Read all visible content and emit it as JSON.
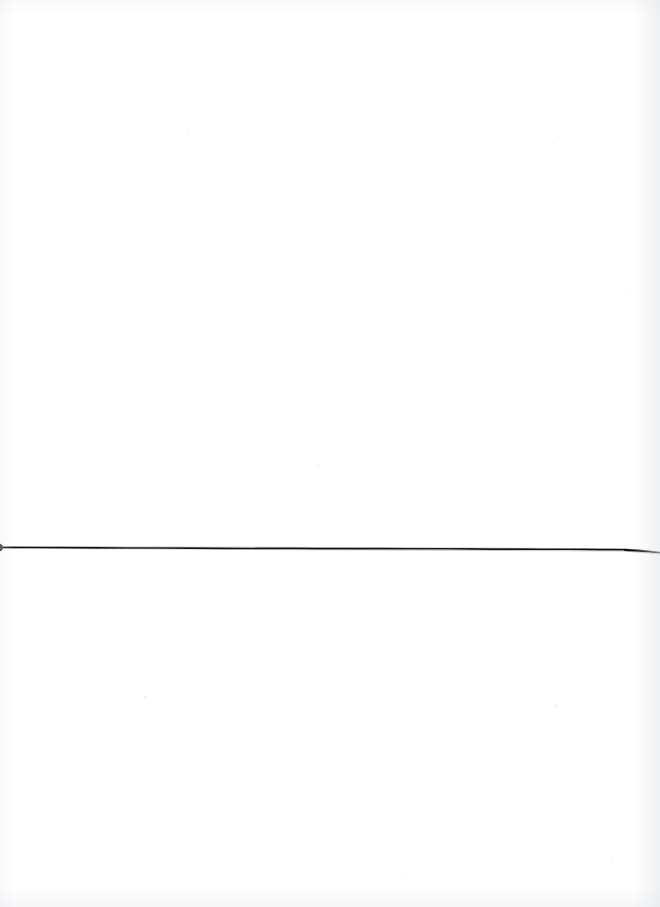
{
  "page": {
    "kind": "scanned-blank-page",
    "width": 660,
    "height": 907,
    "background_color": "#ffffff",
    "visible_text": "",
    "description": "Blank white scanned page with a single thin horizontal rule across the lower-middle area"
  },
  "rule": {
    "label": "horizontal-rule",
    "color": "#0d0d0f",
    "start_x": 0,
    "start_y": 547,
    "end_x": 660,
    "end_y": 551,
    "thickness_px": 1.6,
    "left_cap": "tick",
    "right_cap": "tapered-wedge",
    "wedge_start_x": 625,
    "wedge_max_thickness_px": 4
  },
  "artifacts": {
    "vignette_color": "#e6e8ec",
    "speckle_color": "#c8ccd4",
    "speckle_count": 11
  }
}
